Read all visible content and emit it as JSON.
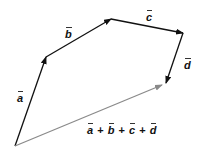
{
  "labels": {
    "a": "a",
    "b": "b",
    "c": "c",
    "d": "d",
    "sum": [
      "a",
      "+",
      "b",
      "+",
      "c",
      "+",
      "d"
    ]
  },
  "colors": {
    "vector": "#111111",
    "resultant": "#8a8a8a"
  },
  "points": {
    "origin": [
      15,
      146
    ],
    "a_tip": [
      46,
      56
    ],
    "b_tip": [
      111,
      19
    ],
    "c_tip": [
      183,
      33
    ],
    "d_tip": [
      166,
      84
    ],
    "resultant_tip": [
      162,
      85
    ]
  }
}
